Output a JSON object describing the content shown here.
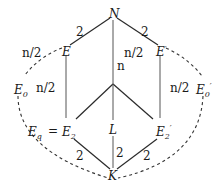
{
  "diagram": {
    "type": "field-extension-lattice",
    "nodes": {
      "N": {
        "label": "N",
        "x": 113,
        "y": 14
      },
      "E": {
        "label": "E",
        "x": 67,
        "y": 48
      },
      "E_prime": {
        "label": "E",
        "prime": "′",
        "x": 160,
        "y": 48
      },
      "E0_left": {
        "label": "E",
        "sub": "0",
        "x": 16,
        "y": 90
      },
      "E0_right": {
        "label": "E",
        "sub": "0",
        "prime": "′",
        "x": 198,
        "y": 90
      },
      "Eq": {
        "label": "E",
        "sub": "q",
        "x": 26,
        "y": 132
      },
      "eq_sign": "=",
      "E2": {
        "label": "E",
        "sub": "2",
        "x": 63,
        "y": 132
      },
      "L": {
        "label": "L",
        "x": 110,
        "y": 132
      },
      "E2_prime": {
        "label": "E",
        "sub": "2",
        "prime": "′",
        "x": 155,
        "y": 132
      },
      "K": {
        "label": "K",
        "x": 110,
        "y": 178
      }
    },
    "edge_labels": {
      "N_E": "2",
      "N_Eprime": "2",
      "N_center": "n",
      "E_E0": "n/2",
      "E0_E2": "n/2",
      "center_Eprime": "n/2",
      "Eprime_E0prime": "n/2",
      "L_K": "2",
      "E2_K": "2",
      "E2prime_K": "2"
    }
  }
}
